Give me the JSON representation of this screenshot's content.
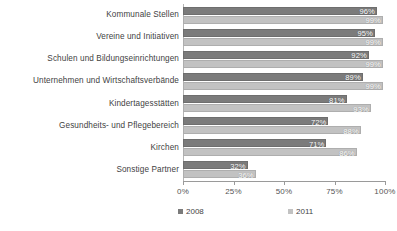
{
  "chart_data": {
    "type": "bar",
    "orientation": "horizontal",
    "title": "",
    "xlabel": "",
    "ylabel": "",
    "xlim": [
      0,
      100
    ],
    "xticks": [
      "0%",
      "25%",
      "50%",
      "75%",
      "100%"
    ],
    "xtick_values": [
      0,
      25,
      50,
      75,
      100
    ],
    "grid": false,
    "legend_position": "bottom",
    "categories": [
      "Kommunale Stellen",
      "Vereine und Initiativen",
      "Schulen und Bildungseinrichtungen",
      "Unternehmen und Wirtschaftsverbände",
      "Kindertagesstätten",
      "Gesundheits- und Pflegebereich",
      "Kirchen",
      "Sonstige Partner"
    ],
    "series": [
      {
        "name": "2008",
        "color": "#7b7b7b",
        "values": [
          96,
          95,
          92,
          89,
          81,
          72,
          71,
          32
        ],
        "labels": [
          "96%",
          "95%",
          "92%",
          "89%",
          "81%",
          "72%",
          "71%",
          "32%"
        ]
      },
      {
        "name": "2011",
        "color": "#c2c2c2",
        "values": [
          99,
          99,
          99,
          99,
          93,
          88,
          86,
          36
        ],
        "labels": [
          "99%",
          "99%",
          "99%",
          "99%",
          "93%",
          "88%",
          "86%",
          "36%"
        ]
      }
    ]
  },
  "legend": {
    "items": [
      {
        "label": "2008",
        "color": "#7b7b7b"
      },
      {
        "label": "2011",
        "color": "#c2c2c2"
      }
    ]
  }
}
